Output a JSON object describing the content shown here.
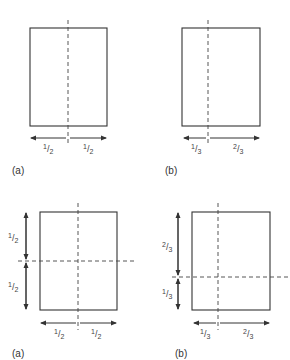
{
  "panels": [
    {
      "id": "top-a",
      "caption": "(a)",
      "split": "vertical",
      "horizontal_dims": [
        {
          "num": "1",
          "den": "2"
        },
        {
          "num": "1",
          "den": "2"
        }
      ]
    },
    {
      "id": "top-b",
      "caption": "(b)",
      "split": "vertical",
      "horizontal_dims": [
        {
          "num": "1",
          "den": "3"
        },
        {
          "num": "2",
          "den": "3"
        }
      ]
    },
    {
      "id": "bottom-a",
      "caption": "(a)",
      "split": "both",
      "vertical_dims": [
        {
          "num": "1",
          "den": "2"
        },
        {
          "num": "1",
          "den": "2"
        }
      ],
      "horizontal_dims": [
        {
          "num": "1",
          "den": "2"
        },
        {
          "num": "1",
          "den": "2"
        }
      ]
    },
    {
      "id": "bottom-b",
      "caption": "(b)",
      "split": "both",
      "vertical_dims": [
        {
          "num": "2",
          "den": "3"
        },
        {
          "num": "1",
          "den": "3"
        }
      ],
      "horizontal_dims": [
        {
          "num": "1",
          "den": "3"
        },
        {
          "num": "2",
          "den": "3"
        }
      ]
    }
  ],
  "colors": {
    "line": "#333333",
    "background": "#ffffff"
  }
}
